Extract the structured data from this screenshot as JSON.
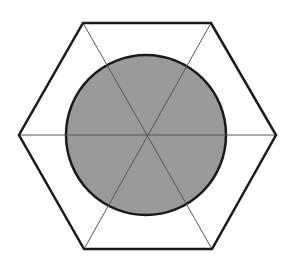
{
  "diagram": {
    "hexagon": {
      "center": [
        147,
        135
      ],
      "vertices": [
        [
          83,
          23
        ],
        [
          211,
          23
        ],
        [
          276,
          135
        ],
        [
          212,
          249
        ],
        [
          84,
          249
        ],
        [
          19,
          135
        ]
      ],
      "stroke": "#1a1a1a",
      "stroke_width": 2.5,
      "fill": "#ffffff"
    },
    "diagonals": {
      "lines": [
        [
          [
            83,
            23
          ],
          [
            212,
            249
          ]
        ],
        [
          [
            211,
            23
          ],
          [
            84,
            249
          ]
        ],
        [
          [
            19,
            135
          ],
          [
            276,
            135
          ]
        ]
      ],
      "stroke": "#555555",
      "stroke_width": 1
    },
    "circle": {
      "cx": 146,
      "cy": 135,
      "r": 80,
      "fill": "#9a9a9a",
      "stroke": "#1a1a1a",
      "stroke_width": 2.5
    }
  }
}
